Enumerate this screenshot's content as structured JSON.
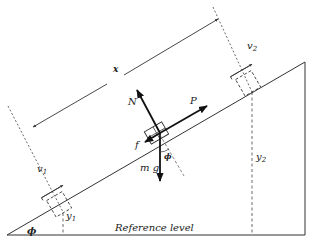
{
  "diagram": {
    "type": "inclined-plane-free-body",
    "labels": {
      "x": "x",
      "v1": "v",
      "v1_sub": "1",
      "v2": "v",
      "v2_sub": "2",
      "y1": "y",
      "y1_sub": "1",
      "y2": "y",
      "y2_sub": "2",
      "N": "N",
      "P": "P",
      "f": "f",
      "mg": "m g",
      "phi_block": "ϕ",
      "phi_base": "ϕ",
      "reference": "Reference level"
    },
    "colors": {
      "line": "#333333",
      "arrow": "#111111",
      "text": "#222222",
      "background": "#ffffff"
    }
  }
}
